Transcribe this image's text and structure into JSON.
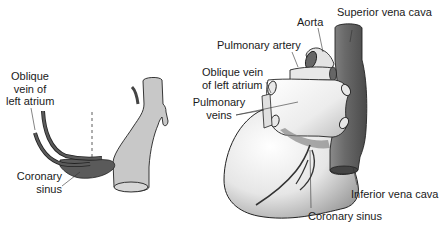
{
  "figure": {
    "left_panel": {
      "labels": {
        "oblique_vein": [
          "Oblique",
          "vein of",
          "left atrium"
        ],
        "coronary_sinus": [
          "Coronary",
          "sinus"
        ]
      }
    },
    "right_panel": {
      "labels": {
        "aorta": "Aorta",
        "superior_vena_cava": "Superior vena cava",
        "pulmonary_artery": "Pulmonary artery",
        "oblique_vein": [
          "Oblique vein",
          "of left atrium"
        ],
        "pulmonary_veins": [
          "Pulmonary",
          "veins"
        ],
        "inferior_vena_cava": "Inferior vena cava",
        "coronary_sinus": "Coronary sinus"
      }
    },
    "colors": {
      "vein_dark": "#5a5a5a",
      "vessel_gray": "#c8c8c8",
      "outline": "#222222",
      "text": "#1a1a1a"
    }
  }
}
